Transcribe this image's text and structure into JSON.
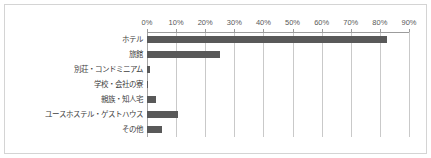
{
  "chart_data": {
    "type": "bar",
    "orientation": "horizontal",
    "title": "",
    "subtitle": "",
    "xlabel": "",
    "ylabel": "",
    "xlim": [
      0,
      90
    ],
    "grid": true,
    "legend": false,
    "legend_position": "none",
    "bar_color": "#595959",
    "gridline_color": "#c9c9c9",
    "axis_color": "#9c9c9c",
    "frame_color": "#d4d4d4",
    "categories": [
      "ホテル",
      "旅館",
      "別荘・コンドミニアム",
      "学校・会社の寮",
      "親族・知人宅",
      "ユースホステル・ゲストハウス",
      "その他"
    ],
    "values": [
      82.5,
      25.0,
      1.2,
      0.2,
      3.2,
      10.5,
      5.2
    ],
    "tick_labels": [
      "0%",
      "10%",
      "20%",
      "30%",
      "40%",
      "50%",
      "60%",
      "70%",
      "80%",
      "90%"
    ],
    "tick_values": [
      0,
      10,
      20,
      30,
      40,
      50,
      60,
      70,
      80,
      90
    ]
  }
}
